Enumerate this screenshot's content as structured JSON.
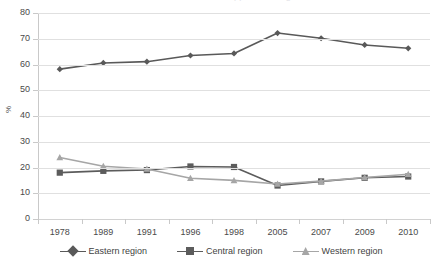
{
  "chart_data": {
    "type": "line",
    "title": "",
    "xlabel": "",
    "ylabel": "%",
    "categories": [
      "1978",
      "1989",
      "1991",
      "1996",
      "1998",
      "2005",
      "2007",
      "2009",
      "2010"
    ],
    "ylim": [
      0,
      80
    ],
    "yticks": [
      0,
      10,
      20,
      30,
      40,
      50,
      60,
      70,
      80
    ],
    "grid": true,
    "legend_position": "bottom",
    "series": [
      {
        "name": "Eastern region",
        "marker": "diamond",
        "color": "#595959",
        "values": [
          58.2,
          60.6,
          61.1,
          63.5,
          64.3,
          72.2,
          70.2,
          67.6,
          66.3
        ]
      },
      {
        "name": "Central region",
        "marker": "square",
        "color": "#5c5c5c",
        "values": [
          18.0,
          18.7,
          19.0,
          20.4,
          20.2,
          13.0,
          14.6,
          16.0,
          16.5
        ]
      },
      {
        "name": "Western region",
        "marker": "triangle",
        "color": "#a6a6a6",
        "values": [
          23.9,
          20.5,
          19.4,
          15.8,
          15.0,
          13.6,
          14.7,
          16.1,
          17.4
        ]
      }
    ]
  },
  "axis": {
    "y_tick_labels": [
      "80",
      "70",
      "60",
      "50",
      "40",
      "30",
      "20",
      "10",
      "0"
    ],
    "y_axis_title": "%"
  },
  "legend": {
    "items": [
      {
        "label": "Eastern region"
      },
      {
        "label": "Central region"
      },
      {
        "label": "Western region"
      }
    ]
  },
  "title_remnant": "clipped heading"
}
